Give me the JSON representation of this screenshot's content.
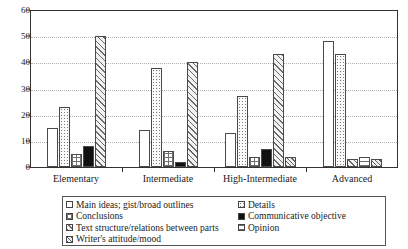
{
  "chart_data": {
    "type": "bar",
    "title": "",
    "xlabel": "",
    "ylabel": "",
    "ylim": [
      0,
      60
    ],
    "yticks": [
      0,
      10,
      20,
      30,
      40,
      50,
      60
    ],
    "grid": true,
    "legend_position": "bottom",
    "categories": [
      "Elementary",
      "Intermediate",
      "High-Intermediate",
      "Advanced"
    ],
    "series": [
      {
        "name": "Main ideas; gist/broad outlines",
        "pattern": "empty",
        "values": [
          15,
          14,
          13,
          48
        ]
      },
      {
        "name": "Details",
        "pattern": "dots",
        "values": [
          23,
          38,
          27,
          43
        ]
      },
      {
        "name": "Conclusions",
        "pattern": "grid",
        "values": [
          5,
          6,
          4,
          0
        ]
      },
      {
        "name": "Communicative objective",
        "pattern": "solid",
        "values": [
          8,
          2,
          7,
          0
        ]
      },
      {
        "name": "Text structure/relations between parts",
        "pattern": "diag",
        "values": [
          50,
          40,
          43,
          3
        ]
      },
      {
        "name": "Opinion",
        "pattern": "horiz",
        "values": [
          0,
          0,
          0,
          4
        ]
      },
      {
        "name": "Writer's attitude/mood",
        "pattern": "densediag",
        "values": [
          0,
          0,
          4,
          3
        ]
      }
    ]
  },
  "legend": {
    "left_column": [
      {
        "label": "Main ideas; gist/broad outlines",
        "pattern": "empty"
      },
      {
        "label": "Conclusions",
        "pattern": "grid"
      },
      {
        "label": "Text structure/relations between parts",
        "pattern": "diag"
      },
      {
        "label": "Writer's attitude/mood",
        "pattern": "densediag"
      }
    ],
    "right_column": [
      {
        "label": "Details",
        "pattern": "dots"
      },
      {
        "label": "Communicative objective",
        "pattern": "solid"
      },
      {
        "label": "Opinion",
        "pattern": "horiz"
      }
    ]
  },
  "colors": {
    "axis": "#333333",
    "grid": "#b0b0b0",
    "bar_outline": "#4a4a4a",
    "solid_fill": "#111111",
    "background": "#ffffff"
  }
}
